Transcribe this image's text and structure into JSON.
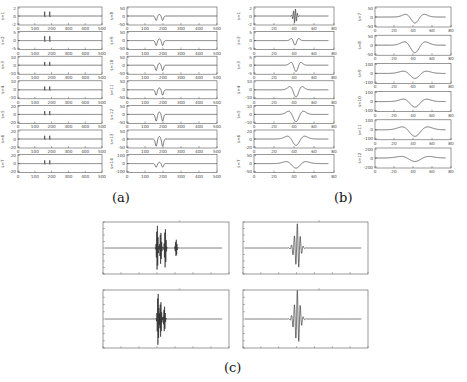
{
  "figure": {
    "captions": {
      "a": "(a)",
      "b": "(b)",
      "c": "(c)"
    },
    "colors": {
      "line": "#222222",
      "axis": "#555555",
      "tick_text": "#444444",
      "background": "#ffffff"
    }
  },
  "chart_data": [
    {
      "panel": "a-left",
      "type": "line",
      "xlim": [
        0,
        500
      ],
      "xticks": [
        "0",
        "100",
        "200",
        "300",
        "400",
        "500"
      ],
      "subplots": [
        {
          "ylabel": "s=1",
          "ylim": [
            -2,
            2
          ],
          "yticks": [
            "2",
            "0",
            "-2"
          ],
          "shape": "spikes",
          "centers": [
            160,
            190
          ],
          "amp": 0.8
        },
        {
          "ylabel": "s=2",
          "ylim": [
            -5,
            5
          ],
          "yticks": [
            "5",
            "0",
            "-5"
          ],
          "shape": "spikes",
          "centers": [
            160,
            190
          ],
          "amp": 0.8
        },
        {
          "ylabel": "s=3",
          "ylim": [
            -10,
            10
          ],
          "yticks": [
            "10",
            "0",
            "-10"
          ],
          "shape": "spikes",
          "centers": [
            160,
            190
          ],
          "amp": 0.6
        },
        {
          "ylabel": "s=4",
          "ylim": [
            -10,
            10
          ],
          "yticks": [
            "10",
            "0",
            "-10"
          ],
          "shape": "spikes",
          "centers": [
            160,
            190
          ],
          "amp": 0.6
        },
        {
          "ylabel": "s=5",
          "ylim": [
            -20,
            20
          ],
          "yticks": [
            "20",
            "0",
            "-20"
          ],
          "shape": "spikes",
          "centers": [
            160,
            190
          ],
          "amp": 0.6
        },
        {
          "ylabel": "s=6",
          "ylim": [
            -20,
            20
          ],
          "yticks": [
            "20",
            "0",
            "-20"
          ],
          "shape": "spikes",
          "centers": [
            160,
            190
          ],
          "amp": 0.6
        },
        {
          "ylabel": "s=7",
          "ylim": [
            -20,
            20
          ],
          "yticks": [
            "20",
            "0",
            "-20"
          ],
          "shape": "spikes",
          "centers": [
            160,
            190
          ],
          "amp": 0.6
        }
      ]
    },
    {
      "panel": "a-right",
      "type": "line",
      "xlim": [
        0,
        500
      ],
      "xticks": [
        "0",
        "100",
        "200",
        "300",
        "400",
        "500"
      ],
      "subplots": [
        {
          "ylabel": "s=8",
          "ylim": [
            -50,
            50
          ],
          "yticks": [
            "50",
            "0",
            "-50"
          ],
          "shape": "double-dip",
          "center": 180,
          "amp": 0.5
        },
        {
          "ylabel": "s=9",
          "ylim": [
            -50,
            50
          ],
          "yticks": [
            "50",
            "0",
            "-50"
          ],
          "shape": "double-dip",
          "center": 180,
          "amp": 0.55
        },
        {
          "ylabel": "s=10",
          "ylim": [
            -50,
            50
          ],
          "yticks": [
            "50",
            "0",
            "-50"
          ],
          "shape": "double-dip",
          "center": 180,
          "amp": 0.6
        },
        {
          "ylabel": "s=11",
          "ylim": [
            -80,
            80
          ],
          "yticks": [
            "50",
            "0",
            "-50"
          ],
          "shape": "double-dip",
          "center": 180,
          "amp": 0.6
        },
        {
          "ylabel": "s=12",
          "ylim": [
            -80,
            80
          ],
          "yticks": [
            "50",
            "0",
            "-50"
          ],
          "shape": "double-dip",
          "center": 180,
          "amp": 0.75
        },
        {
          "ylabel": "s=13",
          "ylim": [
            -80,
            80
          ],
          "yticks": [
            "50",
            "0",
            "-50"
          ],
          "shape": "double-dip",
          "center": 180,
          "amp": 0.8
        },
        {
          "ylabel": "s=14",
          "ylim": [
            -100,
            100
          ],
          "yticks": [
            "100",
            "0",
            "-100"
          ],
          "shape": "double-dip",
          "center": 180,
          "amp": 0.4
        }
      ]
    },
    {
      "panel": "b-left",
      "type": "line",
      "xlim": [
        0,
        80
      ],
      "xticks": [
        "0",
        "20",
        "40",
        "60",
        "80"
      ],
      "subplots": [
        {
          "ylabel": "s=1",
          "ylim": [
            -2,
            2
          ],
          "yticks": [
            "2",
            "0",
            "-2"
          ],
          "shape": "burst",
          "center": 41,
          "amp": 0.8
        },
        {
          "ylabel": "s=2",
          "ylim": [
            -5,
            5
          ],
          "yticks": [
            "5",
            "0",
            "-5"
          ],
          "shape": "wavelet",
          "center": 41,
          "width": 3,
          "amp": 0.5
        },
        {
          "ylabel": "s=3",
          "ylim": [
            -5,
            5
          ],
          "yticks": [
            "5",
            "0",
            "-5"
          ],
          "shape": "wavelet",
          "center": 42,
          "width": 4,
          "amp": 0.7
        },
        {
          "ylabel": "s=4",
          "ylim": [
            -10,
            10
          ],
          "yticks": [
            "10",
            "0",
            "-10"
          ],
          "shape": "wavelet",
          "center": 42,
          "width": 5,
          "amp": 0.8
        },
        {
          "ylabel": "s=5",
          "ylim": [
            -10,
            10
          ],
          "yticks": [
            "10",
            "0",
            "-10"
          ],
          "shape": "wavelet",
          "center": 42,
          "width": 6,
          "amp": 0.8
        },
        {
          "ylabel": "s=6",
          "ylim": [
            -20,
            20
          ],
          "yticks": [
            "20",
            "0",
            "-20"
          ],
          "shape": "wavelet",
          "center": 42,
          "width": 7,
          "amp": 0.7
        },
        {
          "ylabel": "s=7",
          "ylim": [
            -50,
            50
          ],
          "yticks": [
            "50",
            "0",
            "-50"
          ],
          "shape": "wavelet",
          "center": 42,
          "width": 8,
          "amp": 0.5
        }
      ]
    },
    {
      "panel": "b-right",
      "type": "line",
      "xlim": [
        0,
        80
      ],
      "xticks": [
        "0",
        "20",
        "40",
        "60",
        "80"
      ],
      "subplots": [
        {
          "ylabel": "s=7",
          "ylim": [
            -50,
            50
          ],
          "yticks": [
            "50",
            "0",
            "-50"
          ],
          "shape": "wavelet",
          "center": 42,
          "width": 8,
          "amp": 0.6
        },
        {
          "ylabel": "s=8",
          "ylim": [
            -50,
            50
          ],
          "yticks": [
            "50",
            "0",
            "-50"
          ],
          "shape": "wavelet",
          "center": 42,
          "width": 9,
          "amp": 0.75
        },
        {
          "ylabel": "s=9",
          "ylim": [
            -100,
            100
          ],
          "yticks": [
            "100",
            "0",
            "-100"
          ],
          "shape": "wavelet",
          "center": 42,
          "width": 10,
          "amp": 0.5
        },
        {
          "ylabel": "s=10",
          "ylim": [
            -100,
            100
          ],
          "yticks": [
            "100",
            "0",
            "-100"
          ],
          "shape": "wavelet",
          "center": 42,
          "width": 10,
          "amp": 0.55
        },
        {
          "ylabel": "s=11",
          "ylim": [
            -100,
            100
          ],
          "yticks": [
            "100",
            "0",
            "-100"
          ],
          "shape": "wavelet",
          "center": 42,
          "width": 11,
          "amp": 0.65
        },
        {
          "ylabel": "s=12",
          "ylim": [
            -200,
            200
          ],
          "yticks": [
            "200",
            "0",
            "-200"
          ],
          "shape": "wavelet",
          "center": 42,
          "width": 12,
          "amp": 0.35
        }
      ]
    },
    {
      "panel": "c",
      "type": "line",
      "title": "",
      "subplots": [
        {
          "id": "c-top-left",
          "shape": "multi-burst",
          "xlim": [
            0,
            700
          ],
          "bursts": [
            [
              300,
              0.9
            ],
            [
              320,
              0.7
            ],
            [
              345,
              0.8
            ],
            [
              405,
              0.35
            ]
          ]
        },
        {
          "id": "c-top-right",
          "shape": "ricker-burst",
          "xlim": [
            0,
            700
          ],
          "center": 300,
          "amp": 0.95
        },
        {
          "id": "c-bottom-left",
          "shape": "multi-burst",
          "xlim": [
            0,
            700
          ],
          "bursts": [
            [
              305,
              0.95
            ],
            [
              320,
              0.7
            ],
            [
              340,
              0.45
            ]
          ]
        },
        {
          "id": "c-bottom-right",
          "shape": "ricker-burst",
          "xlim": [
            0,
            700
          ],
          "center": 300,
          "amp": 1.0
        }
      ]
    }
  ]
}
